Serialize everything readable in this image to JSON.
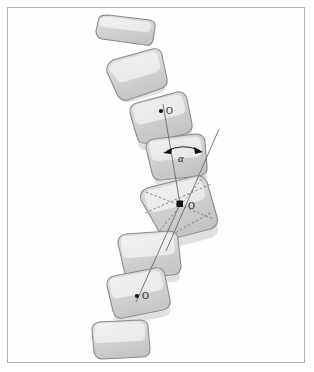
{
  "figure": {
    "frame": {
      "border_color": "#b0b0b0",
      "background_color": "#fefefe"
    },
    "colors": {
      "vertebra_fill": "#d4d4d4",
      "vertebra_fill_light": "#dddddd",
      "vertebra_stroke": "#8c8c8c",
      "axis_line": "#6b6b6b",
      "dashed_line": "#787878",
      "marker": "#111111",
      "label": "#141414"
    },
    "labels": {
      "center_top": "O",
      "center_middle": "O",
      "center_bottom": "O",
      "angle": "α"
    },
    "markers": {
      "top_center": {
        "name": "center-dot-top",
        "shape": "dot",
        "x": 161,
        "y": 111
      },
      "middle_center": {
        "name": "center-square-middle",
        "shape": "square",
        "x": 180,
        "y": 204
      },
      "bottom_center": {
        "name": "center-dot-bottom",
        "shape": "dot",
        "x": 137,
        "y": 296
      }
    },
    "vertebrae": [
      {
        "index": 1,
        "name": "vertebra-1",
        "rotation_deg": -5
      },
      {
        "index": 2,
        "name": "vertebra-2",
        "rotation_deg": -17
      },
      {
        "index": 3,
        "name": "vertebra-3",
        "rotation_deg": -13,
        "has_center_marker": true
      },
      {
        "index": 4,
        "name": "vertebra-4",
        "rotation_deg": -9,
        "has_angle_marker": true
      },
      {
        "index": 5,
        "name": "vertebra-5",
        "rotation_deg": 14,
        "has_center_marker": true,
        "has_dashed_diagonals": true
      },
      {
        "index": 6,
        "name": "vertebra-6",
        "rotation_deg": 7
      },
      {
        "index": 7,
        "name": "vertebra-7",
        "rotation_deg": 12,
        "has_center_marker": true
      },
      {
        "index": 8,
        "name": "vertebra-8",
        "rotation_deg": 4
      }
    ],
    "reference_lines": [
      {
        "name": "vertical-reference-line",
        "from": [
          161,
          107
        ],
        "to": [
          137,
          300
        ]
      },
      {
        "name": "oblique-reference-line",
        "from": [
          218,
          130
        ],
        "to": [
          168,
          250
        ]
      }
    ]
  }
}
